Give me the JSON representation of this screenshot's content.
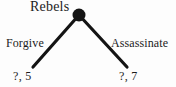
{
  "figure": {
    "type": "extensive-form-game-tree",
    "background_color": "#fdfdfd",
    "ink_color": "#1c1c1c",
    "node_color": "#141414"
  },
  "tree": {
    "decision_node": {
      "player_label": "Rebels",
      "node_shape": "filled-circle",
      "center_x": 79,
      "center_y": 15,
      "radius": 6.5
    },
    "branches": [
      {
        "id": "left",
        "action_label": "Forgive",
        "payoff_label": "?, 5",
        "from_x": 79,
        "from_y": 15,
        "to_x": 33,
        "to_y": 67,
        "stroke_width": 3.2
      },
      {
        "id": "right",
        "action_label": "Assassinate",
        "payoff_label": "?, 7",
        "from_x": 79,
        "from_y": 15,
        "to_x": 127,
        "to_y": 67,
        "stroke_width": 3.2
      }
    ]
  }
}
